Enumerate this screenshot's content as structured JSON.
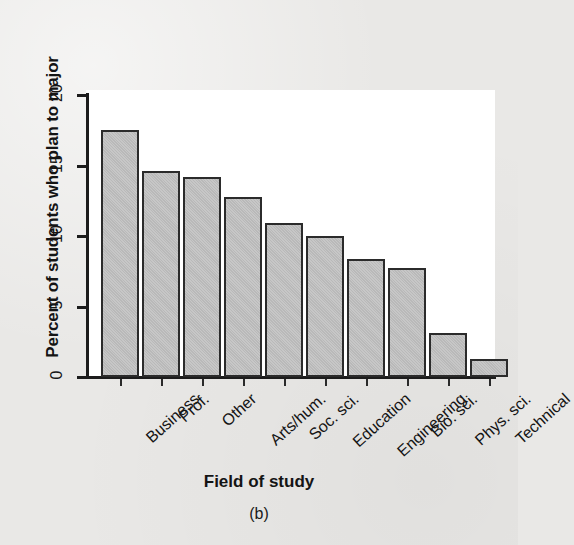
{
  "figure": {
    "caption": "(b)",
    "background_color": "#e9e8e6",
    "plot_background_color": "#ffffff",
    "bar_fill_color": "#bcbcbc",
    "bar_border_color": "#2b2b2b",
    "axis_color": "#1c1c1c"
  },
  "chart_data": {
    "type": "bar",
    "title": "",
    "xlabel": "Field of study",
    "ylabel": "Percent of students who plan to major",
    "categories": [
      "Business",
      "Prof.",
      "Other",
      "Arts/hum.",
      "Soc. sci.",
      "Education",
      "Engineering",
      "Bio. sci.",
      "Phys. sci.",
      "Technical"
    ],
    "values": [
      17.5,
      14.6,
      14.2,
      12.8,
      10.9,
      10.0,
      8.4,
      7.7,
      3.1,
      1.3
    ],
    "ylim": [
      0,
      20
    ],
    "yticks": [
      0,
      5,
      10,
      15,
      20
    ],
    "ytick_labels": [
      "0",
      "5",
      "10",
      "15",
      "20"
    ],
    "grid": false,
    "legend": false
  }
}
